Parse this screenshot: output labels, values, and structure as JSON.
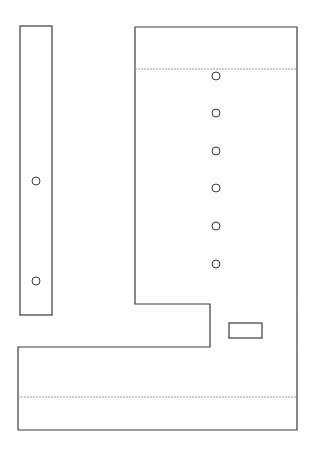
{
  "canvas": {
    "width": 315,
    "height": 452,
    "background": "#ffffff"
  },
  "colors": {
    "stroke": "#3a3a3a",
    "dashed": "#9a9a9a"
  },
  "left_bar": {
    "x": 20,
    "y": 26,
    "width": 32,
    "height": 289
  },
  "left_bar_holes": [
    {
      "cx": 36,
      "cy": 181,
      "r": 4
    },
    {
      "cx": 36,
      "cy": 281,
      "r": 4
    }
  ],
  "main_outline_points": "135,27 297,27 297,430 18,430 18,347 210,347 210,304 135,304",
  "fold_lines": [
    {
      "x1": 135,
      "y1": 69,
      "x2": 297,
      "y2": 69
    },
    {
      "x1": 18,
      "y1": 397,
      "x2": 297,
      "y2": 397
    }
  ],
  "main_holes": [
    {
      "cx": 216,
      "cy": 76,
      "r": 4
    },
    {
      "cx": 216,
      "cy": 113,
      "r": 4
    },
    {
      "cx": 216,
      "cy": 151,
      "r": 4
    },
    {
      "cx": 216,
      "cy": 188,
      "r": 4
    },
    {
      "cx": 216,
      "cy": 226,
      "r": 4
    },
    {
      "cx": 216,
      "cy": 264,
      "r": 4
    }
  ],
  "slot": {
    "x": 229,
    "y": 323,
    "width": 33,
    "height": 15
  }
}
